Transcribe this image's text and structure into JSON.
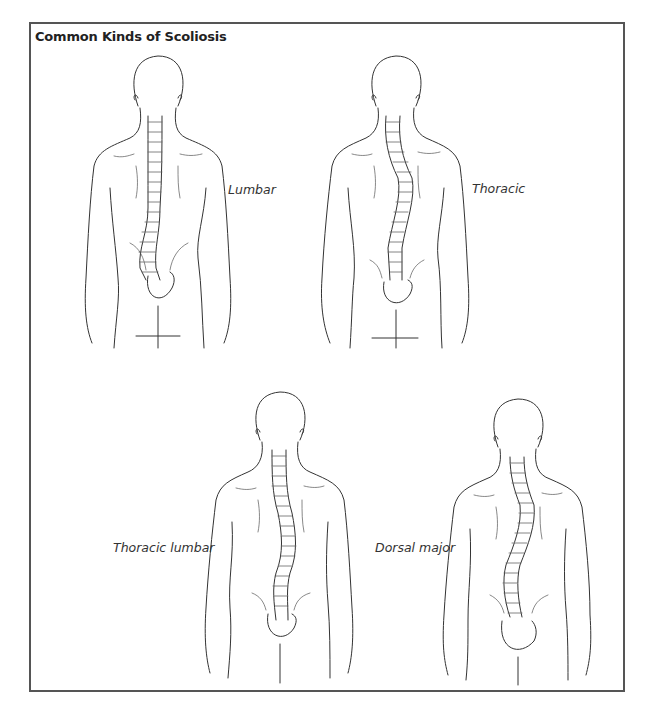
{
  "title": "Common Kinds of Scoliosis",
  "figures": [
    {
      "label": "Lumbar",
      "position": "top-left",
      "curve": "lumbar"
    },
    {
      "label": "Thoracic",
      "position": "top-right",
      "curve": "thoracic"
    },
    {
      "label": "Thoracic lumbar",
      "position": "bottom-left",
      "curve": "thoracic-lumbar"
    },
    {
      "label": "Dorsal major",
      "position": "bottom-right",
      "curve": "dorsal-major"
    }
  ],
  "colors": {
    "line": "#333333",
    "border": "#555555",
    "background": "#ffffff"
  }
}
